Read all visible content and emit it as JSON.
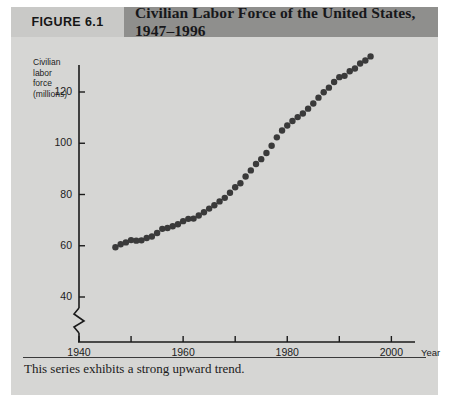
{
  "figure": {
    "number_label": "FIGURE 6.1",
    "title": "Civilian Labor Force of the United States, 1947–1996",
    "caption": "This series exhibits a strong upward trend."
  },
  "colors": {
    "panel_background": "#d6d6d4",
    "figure_number_background": "#c9c9c7",
    "title_background": "#8f8f8d",
    "axis": "#1a1a1a",
    "marker": "#3a3a3a",
    "text": "#1c1c1c"
  },
  "chart_data": {
    "type": "scatter",
    "title": "Civilian Labor Force of the United States, 1947–1996",
    "xlabel": "Year",
    "ylabel": "Civilian labor force (millions)",
    "ylabel_lines": [
      "Civilian",
      "labor",
      "force",
      "(millions)"
    ],
    "xlim": [
      1940,
      2003
    ],
    "ylim": [
      36,
      132
    ],
    "y_axis_broken": true,
    "y_break_below": 40,
    "grid": false,
    "legend": null,
    "xticks": [
      1940,
      1950,
      1960,
      1970,
      1980,
      1990,
      2000
    ],
    "xtick_labels": [
      "1940",
      "",
      "1960",
      "",
      "1980",
      "",
      "2000"
    ],
    "yticks": [
      40,
      60,
      80,
      100,
      120
    ],
    "ytick_labels": [
      "40",
      "60",
      "80",
      "100",
      "120"
    ],
    "x": [
      1947,
      1948,
      1949,
      1950,
      1951,
      1952,
      1953,
      1954,
      1955,
      1956,
      1957,
      1958,
      1959,
      1960,
      1961,
      1962,
      1963,
      1964,
      1965,
      1966,
      1967,
      1968,
      1969,
      1970,
      1971,
      1972,
      1973,
      1974,
      1975,
      1976,
      1977,
      1978,
      1979,
      1980,
      1981,
      1982,
      1983,
      1984,
      1985,
      1986,
      1987,
      1988,
      1989,
      1990,
      1991,
      1992,
      1993,
      1994,
      1995,
      1996
    ],
    "values": [
      59.4,
      60.6,
      61.3,
      62.2,
      62.0,
      62.1,
      63.0,
      63.6,
      65.0,
      66.6,
      66.9,
      67.6,
      68.4,
      69.6,
      70.5,
      70.6,
      71.8,
      73.1,
      74.5,
      75.8,
      77.3,
      78.7,
      80.7,
      82.8,
      84.4,
      87.0,
      89.4,
      91.9,
      93.8,
      96.2,
      99.0,
      102.3,
      105.0,
      106.9,
      108.7,
      110.2,
      111.6,
      113.5,
      115.5,
      117.8,
      119.9,
      121.7,
      123.9,
      125.8,
      126.3,
      128.1,
      129.2,
      131.1,
      132.3,
      133.9
    ],
    "marker_shape": "filled-circle",
    "marker_size_px": 3.2,
    "annotation": "This series exhibits a strong upward trend."
  }
}
